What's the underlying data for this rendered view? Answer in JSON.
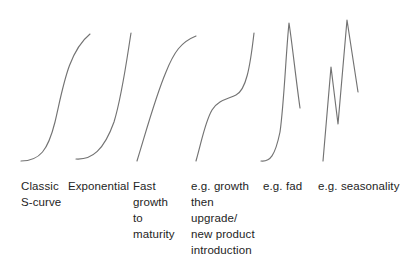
{
  "figure": {
    "background_color": "#ffffff",
    "curve_color": "#737373",
    "text_color": "#242424"
  },
  "chart_data": {
    "type": "line",
    "xlabel": "",
    "ylabel": "",
    "grid": false,
    "legend": "none",
    "axis_visible": false,
    "xlim": [
      0,
      413
    ],
    "ylim": [
      0,
      269
    ],
    "series": [
      {
        "name": "Classic S-curve",
        "caption": "Classic\nS-curve",
        "shape": "sigmoid",
        "path": "M 21 161 C 40 161, 48 150, 55 122 C 63 88, 68 52, 90 34",
        "points": [
          [
            21,
            161
          ],
          [
            30,
            160
          ],
          [
            40,
            155
          ],
          [
            48,
            140
          ],
          [
            55,
            118
          ],
          [
            62,
            90
          ],
          [
            70,
            62
          ],
          [
            79,
            44
          ],
          [
            90,
            34
          ]
        ]
      },
      {
        "name": "Exponential",
        "caption": "Exponential",
        "shape": "exponential",
        "path": "M 76 159 C 92 160, 104 150, 114 122 C 122 96, 127 58, 131 33",
        "points": [
          [
            76,
            159
          ],
          [
            86,
            160
          ],
          [
            96,
            156
          ],
          [
            106,
            142
          ],
          [
            114,
            119
          ],
          [
            121,
            92
          ],
          [
            126,
            62
          ],
          [
            131,
            33
          ]
        ]
      },
      {
        "name": "Fast growth to maturity",
        "caption": "Fast\ngrowth\nto\nmaturity",
        "shape": "logarithmic",
        "path": "M 137 161 C 146 132, 155 98, 166 72 C 174 52, 181 42, 196 36",
        "points": [
          [
            137,
            161
          ],
          [
            143,
            140
          ],
          [
            150,
            116
          ],
          [
            158,
            92
          ],
          [
            166,
            70
          ],
          [
            176,
            52
          ],
          [
            186,
            42
          ],
          [
            196,
            36
          ]
        ]
      },
      {
        "name": "Growth then upgrade / new product introduction",
        "caption": "e.g. growth\nthen\nupgrade/\nnew product\nintroduction",
        "shape": "double-sigmoid",
        "path": "M 196 161 C 202 140, 205 122, 212 110 C 218 100, 228 99, 236 95 C 246 90, 250 68, 254 33",
        "points": [
          [
            196,
            161
          ],
          [
            200,
            145
          ],
          [
            204,
            126
          ],
          [
            210,
            112
          ],
          [
            218,
            101
          ],
          [
            228,
            98
          ],
          [
            238,
            92
          ],
          [
            246,
            74
          ],
          [
            250,
            54
          ],
          [
            254,
            33
          ]
        ]
      },
      {
        "name": "Fad",
        "caption": "e.g. fad",
        "shape": "peak-and-collapse",
        "path": "M 261 161 C 270 162, 275 156, 280 132 C 284 104, 286 52, 289 23 C 292 42, 296 80, 300 108",
        "points": [
          [
            261,
            161
          ],
          [
            268,
            161
          ],
          [
            274,
            154
          ],
          [
            279,
            132
          ],
          [
            283,
            104
          ],
          [
            286,
            62
          ],
          [
            289,
            23
          ],
          [
            293,
            52
          ],
          [
            296,
            82
          ],
          [
            300,
            108
          ]
        ]
      },
      {
        "name": "Seasonality",
        "caption": "e.g. seasonality",
        "shape": "oscillating",
        "path": "M 323 161 L 331 67 L 338 124 L 347 20 L 358 92",
        "points": [
          [
            323,
            161
          ],
          [
            331,
            67
          ],
          [
            338,
            124
          ],
          [
            347,
            20
          ],
          [
            358,
            92
          ]
        ]
      }
    ]
  },
  "captions": [
    {
      "id": "classic",
      "text": "Classic\nS-curve"
    },
    {
      "id": "exponential",
      "text": "Exponential"
    },
    {
      "id": "fast",
      "text": "Fast\ngrowth\nto\nmaturity"
    },
    {
      "id": "growth-then",
      "text": "e.g. growth\nthen\nupgrade/\nnew product\nintroduction"
    },
    {
      "id": "fad",
      "text": "e.g. fad"
    },
    {
      "id": "seasonality",
      "text": "e.g. seasonality"
    }
  ]
}
